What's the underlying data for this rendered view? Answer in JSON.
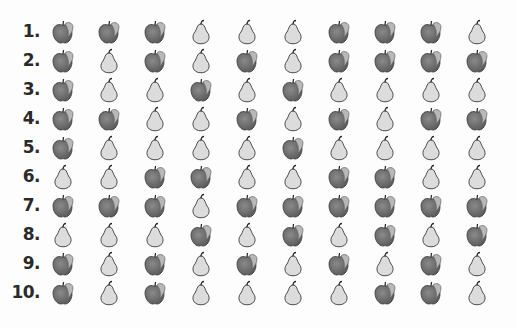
{
  "worksheet": {
    "rows": [
      {
        "label": "1.",
        "items": [
          "apple",
          "apple",
          "apple",
          "pear",
          "pear",
          "pear",
          "apple",
          "apple",
          "apple",
          "pear"
        ]
      },
      {
        "label": "2.",
        "items": [
          "apple",
          "pear",
          "apple",
          "pear",
          "apple",
          "pear",
          "apple",
          "apple",
          "apple",
          "apple"
        ]
      },
      {
        "label": "3.",
        "items": [
          "apple",
          "pear",
          "pear",
          "apple",
          "pear",
          "apple",
          "pear",
          "pear",
          "pear",
          "pear"
        ]
      },
      {
        "label": "4.",
        "items": [
          "apple",
          "apple",
          "pear",
          "pear",
          "apple",
          "pear",
          "apple",
          "pear",
          "apple",
          "apple"
        ]
      },
      {
        "label": "5.",
        "items": [
          "apple",
          "pear",
          "pear",
          "pear",
          "pear",
          "apple",
          "pear",
          "pear",
          "pear",
          "pear"
        ]
      },
      {
        "label": "6.",
        "items": [
          "pear",
          "pear",
          "apple",
          "apple",
          "pear",
          "pear",
          "apple",
          "apple",
          "pear",
          "pear"
        ]
      },
      {
        "label": "7.",
        "items": [
          "apple",
          "apple",
          "apple",
          "pear",
          "apple",
          "apple",
          "apple",
          "apple",
          "apple",
          "apple"
        ]
      },
      {
        "label": "8.",
        "items": [
          "pear",
          "pear",
          "pear",
          "apple",
          "pear",
          "apple",
          "pear",
          "apple",
          "pear",
          "apple"
        ]
      },
      {
        "label": "9.",
        "items": [
          "apple",
          "pear",
          "apple",
          "pear",
          "apple",
          "pear",
          "apple",
          "pear",
          "apple",
          "pear"
        ]
      },
      {
        "label": "10.",
        "items": [
          "apple",
          "pear",
          "apple",
          "pear",
          "pear",
          "pear",
          "pear",
          "apple",
          "apple",
          "pear"
        ]
      }
    ],
    "icons": {
      "apple": "apple-icon",
      "pear": "pear-icon"
    },
    "colors": {
      "apple_body": "#5a5a5a",
      "apple_leaf": "#b8b8b8",
      "pear_body": "#dcdcdc",
      "outline": "#3a3a3a"
    }
  }
}
